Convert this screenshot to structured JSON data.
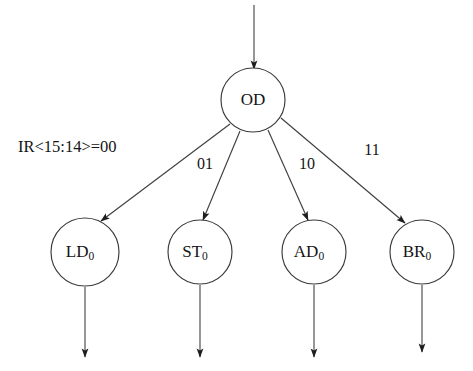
{
  "diagram": {
    "type": "state-transition-tree",
    "background_color": "#ffffff",
    "stroke_color": "#3a3a3a",
    "text_color": "#141414",
    "root": {
      "id": "OD",
      "label": "OD",
      "cx": 253,
      "cy": 100,
      "r": 32
    },
    "children": [
      {
        "id": "LD0",
        "label_main": "LD",
        "label_sub": "0",
        "cx": 85,
        "cy": 252,
        "r": 34,
        "edge_label": "IR<15:14>=00",
        "edge_label_x": 18,
        "edge_label_y": 148,
        "edge_label_anchor": "start",
        "edge_from": [
          230,
          124
        ],
        "edge_to": [
          101,
          221
        ],
        "exit_arrow": {
          "x": 85,
          "y1": 287,
          "y2": 357
        }
      },
      {
        "id": "ST0",
        "label_main": "ST",
        "label_sub": "0",
        "cx": 200,
        "cy": 252,
        "r": 32,
        "edge_label": "01",
        "edge_label_x": 205,
        "edge_label_y": 165,
        "edge_label_anchor": "middle",
        "edge_from": [
          240,
          131
        ],
        "edge_to": [
          203,
          220
        ],
        "exit_arrow": {
          "x": 200,
          "y1": 285,
          "y2": 357
        }
      },
      {
        "id": "AD0",
        "label_main": "AD",
        "label_sub": "0",
        "cx": 314,
        "cy": 252,
        "r": 32,
        "edge_label": "10",
        "edge_label_x": 307,
        "edge_label_y": 165,
        "edge_label_anchor": "middle",
        "edge_from": [
          268,
          130
        ],
        "edge_to": [
          308,
          220
        ],
        "exit_arrow": {
          "x": 314,
          "y1": 285,
          "y2": 357
        }
      },
      {
        "id": "BR0",
        "label_main": "BR",
        "label_sub": "0",
        "cx": 422,
        "cy": 252,
        "r": 32,
        "edge_label": "11",
        "edge_label_x": 372,
        "edge_label_y": 151,
        "edge_label_anchor": "middle",
        "edge_from": [
          281,
          118
        ],
        "edge_to": [
          405,
          223
        ],
        "exit_arrow": {
          "x": 422,
          "y1": 285,
          "y2": 352
        }
      }
    ],
    "entry_arrow": {
      "label": "entry",
      "x": 254,
      "y1": 5,
      "y2": 69
    }
  }
}
